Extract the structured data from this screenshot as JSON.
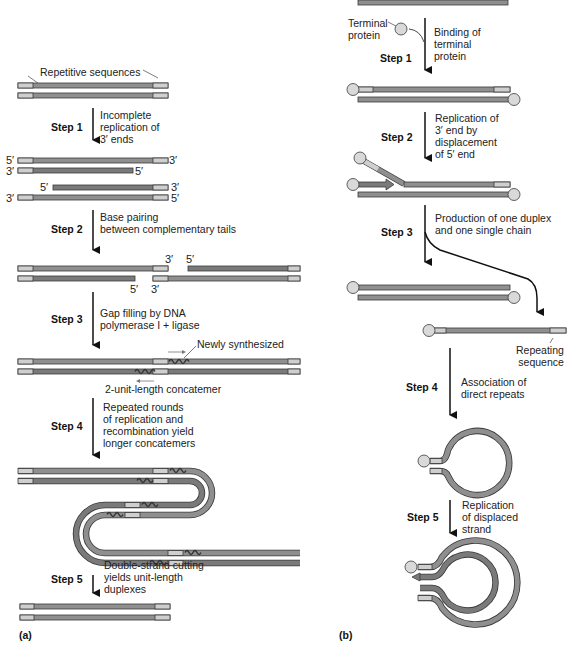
{
  "panel_a": {
    "label": "(a)",
    "top_label": "Repetitive sequences",
    "steps": [
      {
        "name": "Step 1",
        "text": "Incomplete\nreplication of\n3′ ends"
      },
      {
        "name": "Step 2",
        "text": "Base pairing\nbetween complementary tails"
      },
      {
        "name": "Step 3",
        "text": "Gap filling by DNA\npolymerase I + ligase"
      },
      {
        "name": "Step 4",
        "text": "Repeated rounds\nof replication and\nrecombination yield\nlonger concatemers"
      },
      {
        "name": "Step 5",
        "text": "Double-strand cutting\nyields unit-length\nduplexes"
      }
    ],
    "newly_synthesized": "Newly synthesized",
    "concatemer": "2-unit-length concatemer",
    "ends": {
      "five": "5′",
      "three": "3′"
    }
  },
  "panel_b": {
    "label": "(b)",
    "terminal_protein": "Terminal\nprotein",
    "repeating_sequence": "Repeating\nsequence",
    "steps": [
      {
        "name": "Step 1",
        "text": "Binding of\nterminal\nprotein"
      },
      {
        "name": "Step 2",
        "text": "Replication of\n3′ end by\ndisplacement\nof 5′ end"
      },
      {
        "name": "Step 3",
        "text": "Production of one duplex\nand one single chain"
      },
      {
        "name": "Step 4",
        "text": "Association of\ndirect repeats"
      },
      {
        "name": "Step 5",
        "text": "Replication\nof displaced\nstrand"
      }
    ]
  },
  "colors": {
    "strand": "#8f8f8f",
    "strand_dark": "#7a7a7a",
    "repeat": "#cfcfcf",
    "outline": "#3a3a3a",
    "protein": "#d9d9d9",
    "text": "#222222"
  }
}
